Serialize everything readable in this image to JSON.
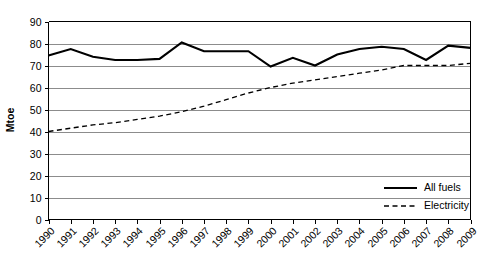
{
  "chart_data": {
    "type": "line",
    "title": "",
    "subtitle": "",
    "xlabel": "",
    "ylabel": "Mtoe",
    "x": [
      "1990",
      "1991",
      "1992",
      "1993",
      "1994",
      "1995",
      "1996",
      "1997",
      "1998",
      "1999",
      "2000",
      "2001",
      "2002",
      "2003",
      "2004",
      "2005",
      "2006",
      "2007",
      "2008",
      "2009"
    ],
    "categories": [
      "1990",
      "1991",
      "1992",
      "1993",
      "1994",
      "1995",
      "1996",
      "1997",
      "1998",
      "1999",
      "2000",
      "2001",
      "2002",
      "2003",
      "2004",
      "2005",
      "2006",
      "2007",
      "2008",
      "2009"
    ],
    "series": [
      {
        "name": "All fuels",
        "style": "solid",
        "color": "#000000",
        "values": [
          74.5,
          77.5,
          74.0,
          72.5,
          72.5,
          73.0,
          80.5,
          76.5,
          76.5,
          76.5,
          69.5,
          73.5,
          70.0,
          75.0,
          77.5,
          78.5,
          77.5,
          72.5,
          79.0,
          78.0
        ]
      },
      {
        "name": "Electricity",
        "style": "dashed",
        "color": "#000000",
        "values": [
          40.0,
          41.5,
          43.0,
          44.0,
          45.5,
          47.0,
          49.0,
          51.5,
          54.5,
          57.5,
          60.0,
          62.0,
          63.5,
          65.0,
          66.5,
          68.0,
          70.0,
          70.0,
          70.0,
          71.0
        ]
      }
    ],
    "ylim": [
      0,
      90
    ],
    "yticks": [
      0,
      10,
      20,
      30,
      40,
      50,
      60,
      70,
      80,
      90
    ],
    "ytick_labels": [
      "0",
      "10",
      "20",
      "30",
      "40",
      "50",
      "60",
      "70",
      "80",
      "90"
    ],
    "grid": "horizontal",
    "grid_color": "#808080",
    "legend_position": "bottom-right",
    "legend_entries": [
      "All fuels",
      "Electricity"
    ],
    "background": "#ffffff",
    "axis_color": "#000000"
  }
}
